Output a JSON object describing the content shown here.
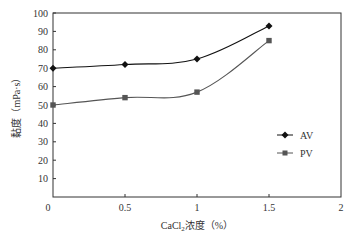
{
  "chart_data": {
    "type": "line",
    "title": "",
    "xlabel": "CaCl2浓度（%）",
    "ylabel": "黏度（mPa·s）",
    "x_ticks": [
      "0",
      "0.5",
      "1",
      "1.5",
      "2"
    ],
    "y_ticks": [
      "10",
      "20",
      "30",
      "40",
      "50",
      "60",
      "70",
      "80",
      "90",
      "100"
    ],
    "xlim": [
      0,
      2
    ],
    "ylim": [
      0,
      100
    ],
    "grid": false,
    "legend_position": "right-middle",
    "x": [
      0,
      0.5,
      1,
      1.5
    ],
    "series": [
      {
        "name": "AV",
        "marker": "diamond",
        "color": "#111111",
        "values": [
          70,
          72,
          75,
          93
        ]
      },
      {
        "name": "PV",
        "marker": "square",
        "color": "#555555",
        "values": [
          50,
          54,
          57,
          85
        ]
      }
    ]
  },
  "labels": {
    "x_axis_main": "CaCl",
    "x_axis_sub": "2",
    "x_axis_rest": "浓度（%）",
    "y_axis": "黏度（mPa·s）",
    "origin": "0",
    "legend_av": "AV",
    "legend_pv": "PV"
  }
}
